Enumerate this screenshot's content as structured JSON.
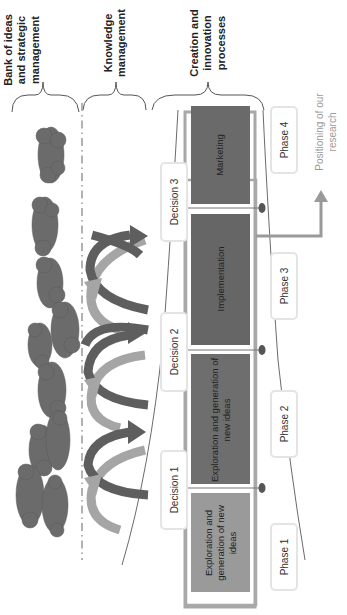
{
  "headers": [
    {
      "id": "bank",
      "lines": [
        "Bank of ideas",
        "and strategic",
        "management"
      ]
    },
    {
      "id": "knowledge",
      "lines": [
        "Knowledge",
        "management"
      ]
    },
    {
      "id": "creation",
      "lines": [
        "Creation and",
        "innovation",
        "processes"
      ]
    }
  ],
  "decisions": [
    "Decision 1",
    "Decision 2",
    "Decision 3"
  ],
  "phases": [
    "Phase 1",
    "Phase 2",
    "Phase 3",
    "Phase 4"
  ],
  "activities": [
    {
      "phase": 1,
      "label": "Exploration and generation of new ideas",
      "color": "#9a9a9a"
    },
    {
      "phase": 2,
      "label": "Exploration and generation of new ideas",
      "color": "#6e6e6e"
    },
    {
      "phase": 3,
      "label": "Implementation",
      "color": "#666666"
    },
    {
      "phase": 4,
      "label": "Marketing",
      "color": "#6a6a6a"
    }
  ],
  "annotation": {
    "lines": [
      "Positioning of our",
      "research"
    ],
    "color": "#9a9a9a"
  },
  "colors": {
    "cloud": "#6b6b6b",
    "frame": "#a8a8a8",
    "node": "#555555",
    "arrow_dark": "#5e5e5e",
    "arrow_light": "#a5a5a5"
  }
}
